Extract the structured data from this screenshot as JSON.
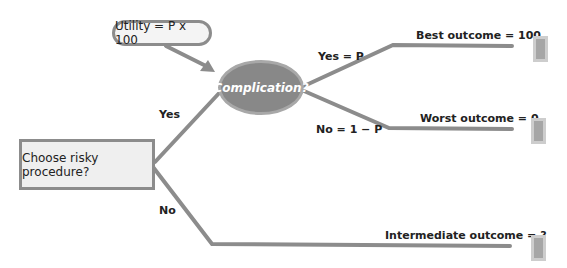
{
  "diagram": {
    "type": "decision-tree",
    "utility_note": "Utility = P x 100",
    "decision_node": "Choose risky procedure?",
    "chance_node": "Complication?",
    "branches": {
      "yes": "Yes",
      "no": "No",
      "chance_yes": "Yes = P",
      "chance_no": "No = 1 − P"
    },
    "outcomes": [
      {
        "label": "Best outcome = 100"
      },
      {
        "label": "Worst outcome = 0"
      },
      {
        "label": "Intermediate outcome = ?"
      }
    ],
    "colors": {
      "line": "#8c8c8c",
      "chance_node_fill": "#888888",
      "terminal_fill": "#a6a6a6"
    }
  }
}
